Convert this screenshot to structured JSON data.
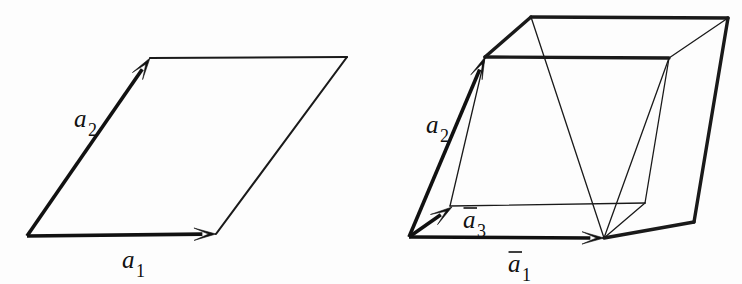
{
  "figure": {
    "background_color": "#fdfdfd",
    "line_color": "#1a1a1a",
    "width": 742,
    "height": 284,
    "panels": [
      {
        "id": "panel-2d",
        "name": "two-dimensional-unit-cell",
        "description": "Parallelogram unit cell defined by basis vectors a1 and a2",
        "origin": [
          27,
          236
        ],
        "cell_polygon": [
          [
            27,
            236
          ],
          [
            216,
            234
          ],
          [
            347,
            57
          ],
          [
            150,
            58
          ]
        ],
        "vectors": [
          {
            "id": "a1",
            "base_label": "a",
            "subscript": "1",
            "overbar": false,
            "start": [
              27,
              236
            ],
            "end": [
              216,
              234
            ],
            "label_position": [
              122,
              268
            ]
          },
          {
            "id": "a2",
            "base_label": "a",
            "subscript": "2",
            "overbar": false,
            "start": [
              27,
              236
            ],
            "end": [
              150,
              58
            ],
            "label_position": [
              74,
              127
            ]
          }
        ],
        "thin_edges": [
          [
            [
              150,
              58
            ],
            [
              347,
              57
            ]
          ],
          [
            [
              347,
              57
            ],
            [
              216,
              234
            ]
          ]
        ]
      },
      {
        "id": "panel-3d",
        "name": "three-dimensional-unit-cell",
        "description": "Parallelepiped unit cell defined by basis vectors a1, a2 and a3 with overbars",
        "origin": [
          409,
          237
        ],
        "vertices": {
          "origin": [
            409,
            237
          ],
          "a1_tip": [
            604,
            238
          ],
          "a2_tip": [
            485,
            57
          ],
          "a3_tip": [
            450,
            206
          ],
          "front_top_right": [
            531,
            17
          ],
          "back_top_right": [
            728,
            18
          ],
          "inner_right": [
            645,
            203
          ],
          "lower_right_back": [
            669,
            58
          ],
          "far_right_low": [
            694,
            222
          ]
        },
        "vectors": [
          {
            "id": "a1",
            "base_label": "a",
            "subscript": "1",
            "overbar": true,
            "start": [
              409,
              237
            ],
            "end": [
              604,
              238
            ],
            "label_position": [
              508,
              272
            ]
          },
          {
            "id": "a2",
            "base_label": "a",
            "subscript": "2",
            "overbar": false,
            "start": [
              409,
              237
            ],
            "end": [
              485,
              57
            ],
            "label_position": [
              426,
              133
            ]
          },
          {
            "id": "a3",
            "base_label": "a",
            "subscript": "3",
            "overbar": true,
            "start": [
              409,
              237
            ],
            "end": [
              452,
              207
            ],
            "label_position": [
              463,
              228
            ]
          }
        ],
        "thick_edges": [
          [
            [
              485,
              57
            ],
            [
              531,
              17
            ]
          ],
          [
            [
              531,
              17
            ],
            [
              728,
              18
            ]
          ],
          [
            [
              485,
              57
            ],
            [
              669,
              58
            ]
          ],
          [
            [
              604,
              238
            ],
            [
              694,
              222
            ]
          ],
          [
            [
              694,
              222
            ],
            [
              728,
              18
            ]
          ]
        ],
        "thin_edges": [
          [
            [
              450,
              206
            ],
            [
              645,
              203
            ]
          ],
          [
            [
              645,
              203
            ],
            [
              669,
              58
            ]
          ],
          [
            [
              450,
              206
            ],
            [
              485,
              57
            ]
          ],
          [
            [
              604,
              238
            ],
            [
              669,
              58
            ]
          ],
          [
            [
              604,
              238
            ],
            [
              645,
              203
            ]
          ],
          [
            [
              531,
              17
            ],
            [
              604,
              238
            ]
          ],
          [
            [
              728,
              18
            ],
            [
              669,
              58
            ]
          ]
        ]
      }
    ]
  }
}
